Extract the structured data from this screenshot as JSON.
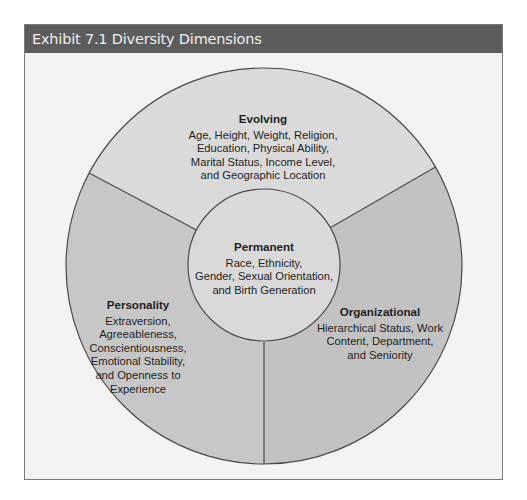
{
  "exhibit": {
    "title": "Exhibit 7.1  Diversity Dimensions"
  },
  "diagram": {
    "colors": {
      "header_bg": "#5c5c5c",
      "frame_bg": "#f3f3f3",
      "evolving_fill": "#dadada",
      "personality_fill": "#c7c7c7",
      "organizational_fill": "#c2c2c2",
      "permanent_fill": "#d9d9d9",
      "stroke": "#4a4a4a"
    },
    "sections": {
      "evolving": {
        "title": "Evolving",
        "lines": [
          "Age, Height, Weight, Religion,",
          "Education, Physical Ability,",
          "Marital Status, Income Level,",
          "and Geographic Location"
        ]
      },
      "permanent": {
        "title": "Permanent",
        "lines": [
          "Race, Ethnicity,",
          "Gender, Sexual Orientation,",
          "and Birth Generation"
        ]
      },
      "personality": {
        "title": "Personality",
        "lines": [
          "Extraversion,",
          "Agreeableness,",
          "Conscientiousness,",
          "Emotional Stability,",
          "and Openness to",
          "Experience"
        ]
      },
      "organizational": {
        "title": "Organizational",
        "lines": [
          "Hierarchical Status, Work",
          "Content, Department,",
          "and Seniority"
        ]
      }
    }
  }
}
